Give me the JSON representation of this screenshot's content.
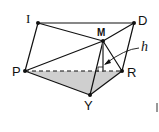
{
  "figure": {
    "type": "solid-geometry",
    "shaded_face": [
      "P",
      "R",
      "Y"
    ],
    "shade_color": "#cfcfcf",
    "line_color": "#111111",
    "vertices": {
      "I": {
        "label": "I",
        "x": 38,
        "y": 23
      },
      "D": {
        "label": "D",
        "x": 134,
        "y": 23
      },
      "M": {
        "label": "M",
        "x": 103,
        "y": 41
      },
      "P": {
        "label": "P",
        "x": 25,
        "y": 71
      },
      "R": {
        "label": "R",
        "x": 122,
        "y": 71
      },
      "Y": {
        "label": "Y",
        "x": 90,
        "y": 95
      }
    },
    "edges_solid": [
      [
        "I",
        "D"
      ],
      [
        "I",
        "P"
      ],
      [
        "I",
        "M"
      ],
      [
        "D",
        "M"
      ],
      [
        "D",
        "R"
      ],
      [
        "P",
        "M"
      ],
      [
        "P",
        "Y"
      ],
      [
        "Y",
        "R"
      ],
      [
        "M",
        "Y"
      ],
      [
        "M",
        "R"
      ]
    ],
    "edges_dashed": [
      [
        "P",
        "R"
      ]
    ],
    "altitude": {
      "from": "M",
      "foot_x": 103,
      "foot_y": 72,
      "label": "h"
    }
  },
  "labels": {
    "I": "I",
    "D": "D",
    "M": "M",
    "P": "P",
    "R": "R",
    "Y": "Y",
    "h": "h"
  }
}
